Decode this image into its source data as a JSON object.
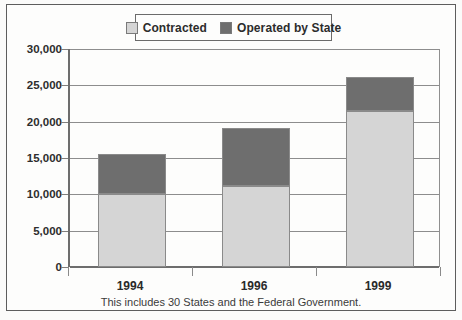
{
  "figure": {
    "footnote": "This includes 30 States and the Federal Government."
  },
  "legend": {
    "position": "top-center",
    "items": [
      {
        "label": "Contracted",
        "color": "#d5d5d5",
        "icon": "legend-swatch-icon"
      },
      {
        "label": "Operated by State",
        "color": "#6e6e6e",
        "icon": "legend-swatch-icon"
      }
    ]
  },
  "axis": {
    "y_ticks": [
      "0",
      "5,000",
      "10,000",
      "15,000",
      "20,000",
      "25,000",
      "30,000"
    ],
    "x_ticks": [
      "1994",
      "1996",
      "1999"
    ]
  },
  "chart_data": {
    "type": "bar",
    "stacked": true,
    "title": "",
    "subtitle": "",
    "xlabel": "",
    "ylabel": "",
    "categories": [
      "1994",
      "1996",
      "1999"
    ],
    "series": [
      {
        "name": "Contracted",
        "color": "#d5d5d5",
        "values": [
          10100,
          11200,
          21400
        ]
      },
      {
        "name": "Operated by State",
        "color": "#6e6e6e",
        "values": [
          5500,
          7900,
          4800
        ]
      }
    ],
    "totals": [
      15600,
      19100,
      26200
    ],
    "ylim": [
      0,
      30000
    ],
    "ytick_values": [
      0,
      5000,
      10000,
      15000,
      20000,
      25000,
      30000
    ],
    "ytick_labels": [
      "0",
      "5,000",
      "10,000",
      "15,000",
      "20,000",
      "25,000",
      "30,000"
    ],
    "grid": true,
    "legend_position": "top-center",
    "annotations": [
      "This includes 30 States and the Federal Government."
    ]
  }
}
